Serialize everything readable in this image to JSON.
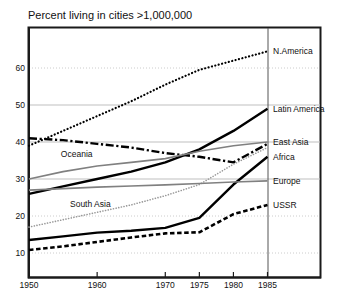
{
  "chart_data": {
    "type": "line",
    "title": "Percent living in cities >1,000,000",
    "xlabel": "",
    "ylabel": "",
    "xlim": [
      1950,
      1985
    ],
    "ylim": [
      5,
      68
    ],
    "xticks": [
      1950,
      1960,
      1970,
      1975,
      1980,
      1985
    ],
    "xtick_labels": [
      "1950",
      "1960",
      "1970",
      "1975",
      "1980",
      "1985"
    ],
    "yticks": [
      10,
      20,
      30,
      40,
      50,
      60
    ],
    "ytick_labels": [
      "10",
      "20",
      "30",
      "40",
      "50",
      "60"
    ],
    "grid": true,
    "grid_axis": "y",
    "legend_position": "right-outside-panel",
    "x": [
      1950,
      1955,
      1960,
      1965,
      1970,
      1975,
      1980,
      1985
    ],
    "series": [
      {
        "name": "N.America",
        "label": "N.America",
        "style": "dotted",
        "color": "#000000",
        "width": 2.2,
        "values": [
          39.0,
          43.0,
          47.0,
          51.0,
          55.5,
          59.5,
          62.0,
          64.5
        ],
        "label_x": 1985,
        "label_y": 64.5
      },
      {
        "name": "Latin America",
        "label": "Latin America",
        "style": "solid",
        "color": "#000000",
        "width": 2.4,
        "values": [
          26.0,
          28.0,
          30.0,
          32.0,
          34.5,
          38.0,
          43.0,
          49.0
        ],
        "label_x": 1985,
        "label_y": 49.0
      },
      {
        "name": "Oceania",
        "label": "Oceania",
        "style": "dashdot",
        "color": "#000000",
        "width": 2.4,
        "values": [
          41.0,
          40.5,
          39.5,
          38.5,
          37.0,
          36.0,
          34.5,
          39.5
        ],
        "label_x": 1957,
        "label_y": 38.2
      },
      {
        "name": "East Asia",
        "label": "East Asia",
        "style": "solid",
        "color": "#808080",
        "width": 1.6,
        "values": [
          30.0,
          32.0,
          33.5,
          34.5,
          35.5,
          37.5,
          39.0,
          40.0
        ],
        "label_x": 1985,
        "label_y": 40.0
      },
      {
        "name": "Africa",
        "label": "Africa",
        "style": "solid",
        "color": "#000000",
        "width": 2.4,
        "values": [
          13.5,
          14.5,
          15.5,
          16.0,
          16.8,
          19.5,
          28.5,
          36.0
        ],
        "label_x": 1985,
        "label_y": 36.0
      },
      {
        "name": "South Asia",
        "label": "South Asia",
        "style": "dotted",
        "color": "#999999",
        "width": 1.6,
        "values": [
          17.0,
          19.0,
          21.0,
          23.0,
          25.5,
          28.5,
          34.0,
          38.5
        ],
        "label_x": 1959,
        "label_y": 24.5
      },
      {
        "name": "Europe",
        "label": "Europe",
        "style": "solid",
        "color": "#808080",
        "width": 1.6,
        "values": [
          27.0,
          27.4,
          27.8,
          28.1,
          28.4,
          28.8,
          29.2,
          29.5
        ],
        "label_x": 1985,
        "label_y": 29.5
      },
      {
        "name": "USSR",
        "label": "USSR",
        "style": "dashed",
        "color": "#000000",
        "width": 2.6,
        "values": [
          10.8,
          11.8,
          13.0,
          14.2,
          15.3,
          15.6,
          20.5,
          23.0
        ],
        "label_x": 1985,
        "label_y": 23.0
      }
    ]
  },
  "figure": {
    "background_color": "#ffffff",
    "axis_color": "#1a1a1a",
    "grid_color": "#bfbfbf"
  }
}
